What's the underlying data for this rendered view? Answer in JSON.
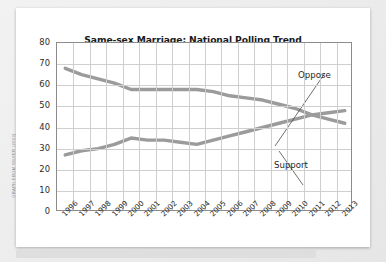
{
  "credit": "GRAPH FROM SILVER (2013)",
  "chart_data": {
    "type": "line",
    "title": "Same-sex Marriage: National Polling Trend",
    "xlabel": "",
    "ylabel": "",
    "ylim": [
      0,
      80
    ],
    "ytick_step": 10,
    "yticks": [
      80,
      70,
      60,
      50,
      40,
      30,
      20,
      10,
      0
    ],
    "grid": true,
    "legend_position": "inline-annotations",
    "categories": [
      "1996",
      "1997",
      "1998",
      "1999",
      "2000",
      "2001",
      "2002",
      "2003",
      "2004",
      "2005",
      "2006",
      "2007",
      "2008",
      "2009",
      "2010",
      "2011",
      "2012",
      "2013"
    ],
    "series": [
      {
        "name": "Oppose",
        "color": "#9b9b9b",
        "values": [
          68,
          65,
          63,
          61,
          58,
          58,
          58,
          58,
          58,
          57,
          55,
          54,
          53,
          51,
          49,
          46,
          44,
          42
        ]
      },
      {
        "name": "Support",
        "color": "#9b9b9b",
        "values": [
          27,
          29,
          30,
          32,
          35,
          34,
          34,
          33,
          32,
          34,
          36,
          38,
          40,
          42,
          44,
          46,
          47,
          48
        ]
      }
    ],
    "annotations": [
      {
        "text": "Oppose",
        "target_year": "2009",
        "target_value": 51
      },
      {
        "text": "Support",
        "target_year": "2008",
        "target_value": 40
      }
    ]
  }
}
